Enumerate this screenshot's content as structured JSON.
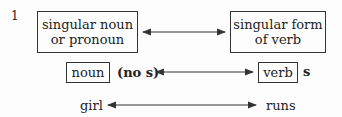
{
  "diagram": {
    "number": "1",
    "top_row": {
      "left_box": [
        "singular noun",
        "or pronoun"
      ],
      "right_box": [
        "singular form",
        "of verb"
      ]
    },
    "middle_row": {
      "left_box": "noun",
      "left_note": "(no s)",
      "right_box": "verb",
      "right_note": "s"
    },
    "bottom_row": {
      "left_word": "girl",
      "right_word": "runs"
    },
    "colors": {
      "line": "#333333",
      "background": "#fdfdfd"
    }
  }
}
